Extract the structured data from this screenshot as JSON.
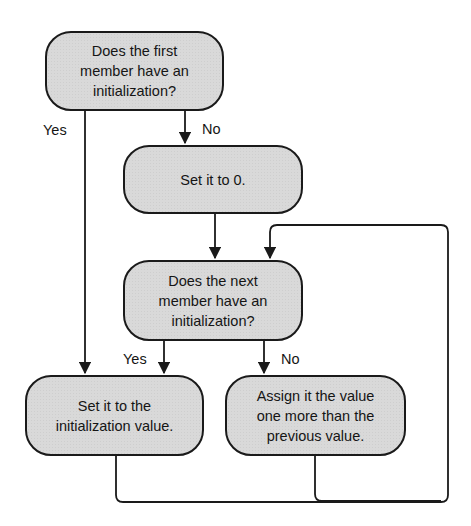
{
  "diagram": {
    "type": "flowchart",
    "colors": {
      "node_fill": "#d9d9d9",
      "stroke": "#1a1a1a",
      "background": "#ffffff"
    },
    "nodes": [
      {
        "id": "first-member-check",
        "text": "Does the first\nmember have an\ninitialization?"
      },
      {
        "id": "set-zero",
        "text": "Set it to 0."
      },
      {
        "id": "next-member-check",
        "text": "Does the next\nmember have an\ninitialization?"
      },
      {
        "id": "set-init-value",
        "text": "Set it to the\ninitialization value."
      },
      {
        "id": "assign-increment",
        "text": "Assign it the value\none more than the\nprevious value."
      }
    ],
    "edges": [
      {
        "from": "first-member-check",
        "to": "set-init-value",
        "label": "Yes"
      },
      {
        "from": "first-member-check",
        "to": "set-zero",
        "label": "No"
      },
      {
        "from": "set-zero",
        "to": "next-member-check",
        "label": ""
      },
      {
        "from": "next-member-check",
        "to": "set-init-value",
        "label": "Yes"
      },
      {
        "from": "next-member-check",
        "to": "assign-increment",
        "label": "No"
      },
      {
        "from": "set-init-value",
        "to": "next-member-check",
        "label": ""
      },
      {
        "from": "assign-increment",
        "to": "next-member-check",
        "label": ""
      }
    ],
    "labels": {
      "first_yes": "Yes",
      "first_no": "No",
      "next_yes": "Yes",
      "next_no": "No"
    }
  }
}
